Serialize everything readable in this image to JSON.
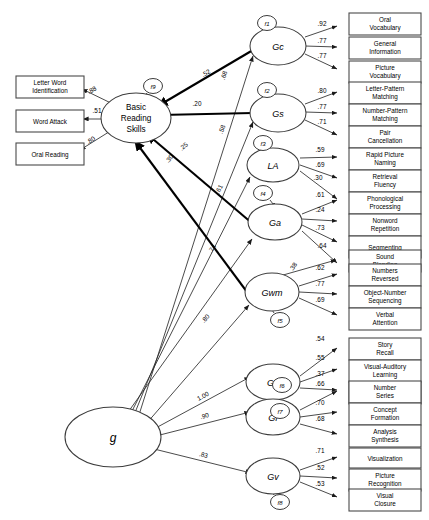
{
  "diagram": {
    "type": "structural-equation-model",
    "title": "",
    "general_factor": {
      "id": "g",
      "label": "g"
    },
    "outcome": {
      "id": "BRS",
      "label_lines": [
        "Basic",
        "Reading",
        "Skills"
      ],
      "residual": "f9"
    },
    "outcome_indicators": [
      {
        "id": "letter-word-identification",
        "label_lines": [
          "Letter Word",
          "Identification"
        ],
        "loading": ".88"
      },
      {
        "id": "word-attack",
        "label_lines": [
          "Word Attack"
        ],
        "loading": ".51"
      },
      {
        "id": "oral-reading",
        "label_lines": [
          "Oral Reading"
        ],
        "loading": ".80"
      }
    ],
    "predictor_paths": [
      {
        "from": "Gc",
        "to": "BRS",
        "coef": ".52"
      },
      {
        "from": "Gs",
        "to": "BRS",
        "coef": ".20"
      },
      {
        "from": "Ga",
        "to": "BRS",
        "coef": ".25"
      },
      {
        "from": "Gwm",
        "to": "BRS",
        "coef": ".30"
      }
    ],
    "cross_path": {
      "from": "Gwm",
      "to": "sound-blending",
      "coef": ".38"
    },
    "factors": [
      {
        "id": "Gc",
        "label": "Gc",
        "residual": "f1",
        "g_loading": ".68",
        "indicators": [
          {
            "id": "oral-vocabulary",
            "label_lines": [
              "Oral",
              "Vocabulary"
            ],
            "loading": ".92"
          },
          {
            "id": "general-information",
            "label_lines": [
              "General",
              "Information"
            ],
            "loading": ".77"
          },
          {
            "id": "picture-vocabulary",
            "label_lines": [
              "Picture",
              "Vocabulary"
            ],
            "loading": ".77"
          }
        ]
      },
      {
        "id": "Gs",
        "label": "Gs",
        "residual": "f2",
        "g_loading": ".58",
        "indicators": [
          {
            "id": "letter-pattern-matching",
            "label_lines": [
              "Letter-Pattern",
              "Matching"
            ],
            "loading": ".80"
          },
          {
            "id": "number-pattern-matching",
            "label_lines": [
              "Number-Pattern",
              "Matching"
            ],
            "loading": ".77"
          },
          {
            "id": "pair-cancellation",
            "label_lines": [
              "Pair",
              "Cancellation"
            ],
            "loading": ".71"
          }
        ]
      },
      {
        "id": "LA",
        "label": "LA",
        "residual": "f3",
        "g_loading": ".61",
        "indicators": [
          {
            "id": "rapid-picture-naming",
            "label_lines": [
              "Rapid Picture",
              "Naming"
            ],
            "loading": ".59"
          },
          {
            "id": "retrieval-fluency",
            "label_lines": [
              "Retrieval",
              "Fluency"
            ],
            "loading": ".69"
          },
          {
            "id": "phonological-processing-la",
            "label_lines": [
              "Phonological",
              "Processing"
            ],
            "loading": ".30"
          }
        ]
      },
      {
        "id": "Ga",
        "label": "Ga",
        "residual": "f4",
        "g_loading": ".74",
        "indicators": [
          {
            "id": "phonological-processing",
            "label_lines": [
              "Phonological",
              "Processing"
            ],
            "loading": ".61"
          },
          {
            "id": "nonword-repetition",
            "label_lines": [
              "Nonword",
              "Repetition"
            ],
            "loading": ".24"
          },
          {
            "id": "segmenting",
            "label_lines": [
              "Segmenting"
            ],
            "loading": ".73"
          },
          {
            "id": "sound-blending",
            "label_lines": [
              "Sound",
              "Blending"
            ],
            "loading": ".64"
          }
        ]
      },
      {
        "id": "Gwm",
        "label": "Gwm",
        "residual": "f5",
        "g_loading": ".80",
        "indicators": [
          {
            "id": "numbers-reversed",
            "label_lines": [
              "Numbers",
              "Reversed"
            ],
            "loading": ".62"
          },
          {
            "id": "object-number-sequencing",
            "label_lines": [
              "Object-Number",
              "Sequencing"
            ],
            "loading": ".77"
          },
          {
            "id": "verbal-attention",
            "label_lines": [
              "Verbal",
              "Attention"
            ],
            "loading": ".69"
          }
        ]
      },
      {
        "id": "Glr",
        "label": "Glr",
        "residual": "f6",
        "g_loading": "1.00",
        "indicators": [
          {
            "id": "story-recall",
            "label_lines": [
              "Story",
              "Recall"
            ],
            "loading": ".54"
          },
          {
            "id": "visual-auditory-learning",
            "label_lines": [
              "Visual-Auditory",
              "Learning"
            ],
            "loading": ".55"
          },
          {
            "id": "memory-for-names",
            "label_lines": [
              "Memory for",
              "Names"
            ],
            "loading": ".37"
          }
        ]
      },
      {
        "id": "Gf",
        "label": "Gf",
        "residual": "f7",
        "g_loading": ".90",
        "indicators": [
          {
            "id": "number-series",
            "label_lines": [
              "Number",
              "Series"
            ],
            "loading": ".66"
          },
          {
            "id": "concept-formation",
            "label_lines": [
              "Concept",
              "Formation"
            ],
            "loading": ".70"
          },
          {
            "id": "analysis-synthesis",
            "label_lines": [
              "Analysis",
              "Synthesis"
            ],
            "loading": ".68"
          }
        ]
      },
      {
        "id": "Gv",
        "label": "Gv",
        "residual": "f8",
        "g_loading": ".83",
        "indicators": [
          {
            "id": "visualization",
            "label_lines": [
              "Visualization"
            ],
            "loading": ".71"
          },
          {
            "id": "picture-recognition",
            "label_lines": [
              "Picture",
              "Recognition"
            ],
            "loading": ".52"
          },
          {
            "id": "visual-closure",
            "label_lines": [
              "Visual",
              "Closure"
            ],
            "loading": ".53"
          }
        ]
      }
    ]
  },
  "colors": {
    "box_stroke": "#4a4a4a",
    "ellipse_stroke": "#3c3c3c",
    "path": "#2b2b2b",
    "path_bold": "#000000",
    "background": "#ffffff"
  }
}
